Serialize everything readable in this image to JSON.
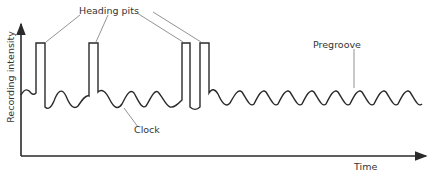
{
  "diagram": {
    "y_axis_label": "Recording intensity",
    "x_axis_label": "Time",
    "annotations": {
      "heading_pits": "Heading pits",
      "pregroove": "Pregroove",
      "clock": "Clock"
    },
    "heading_pits": [
      {
        "x1": 36,
        "x2": 45
      },
      {
        "x1": 89,
        "x2": 98
      },
      {
        "x1": 182,
        "x2": 190
      },
      {
        "x1": 200,
        "x2": 209
      }
    ],
    "colors": {
      "line": "#2a2a2a",
      "leader": "#777777",
      "background": "#ffffff"
    }
  }
}
